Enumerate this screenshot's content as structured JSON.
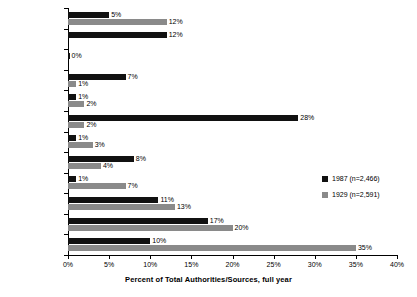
{
  "chart_data": {
    "type": "bar",
    "orientation": "horizontal",
    "title": "",
    "xlabel": "Percent of Total Authorities/Sources, full year",
    "ylabel": "",
    "xlim": [
      0,
      40
    ],
    "xticks": [
      "0%",
      "5%",
      "10%",
      "15%",
      "20%",
      "25%",
      "30%",
      "35%",
      "40%"
    ],
    "xtick_values": [
      0,
      5,
      10,
      15,
      20,
      25,
      30,
      35,
      40
    ],
    "grid": false,
    "legend_position": "middle-right",
    "categories": [
      "N/A",
      "DJIA",
      "Non-profit",
      "Foreign",
      "Local",
      "Expert",
      "Reviews",
      "President",
      "Lobby",
      "Federal",
      "Business",
      "Congress"
    ],
    "series": [
      {
        "name": "1987 (n=2,466)",
        "color": "#111111",
        "values": [
          5,
          12,
          0,
          7,
          1,
          28,
          1,
          8,
          1,
          11,
          17,
          10
        ],
        "labels": [
          "5%",
          "12%",
          "0%",
          "7%",
          "1%",
          "28%",
          "1%",
          "8%",
          "1%",
          "11%",
          "17%",
          "10%"
        ]
      },
      {
        "name": "1929 (n=2,591)",
        "color": "#8a8a8a",
        "values": [
          12,
          null,
          null,
          1,
          2,
          2,
          3,
          4,
          7,
          13,
          20,
          35
        ],
        "labels": [
          "12%",
          "",
          "",
          "1%",
          "2%",
          "2%",
          "3%",
          "4%",
          "7%",
          "13%",
          "20%",
          "35%"
        ]
      }
    ]
  },
  "legend": {
    "items": [
      {
        "label": "1987 (n=2,466)",
        "color": "#111111"
      },
      {
        "label": "1929 (n=2,591)",
        "color": "#8a8a8a"
      }
    ]
  },
  "axis": {
    "x_title": "Percent of Total Authorities/Sources, full year"
  }
}
